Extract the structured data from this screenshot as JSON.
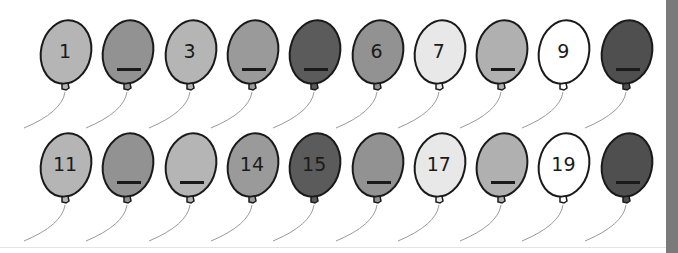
{
  "colors": {
    "light": "#b5b5b5",
    "medium": "#929292",
    "dark": "#5b5b5b",
    "verylight": "#e8e8e8",
    "white": "#ffffff",
    "outline": "#1a1a1a",
    "sidebar": "#7a7a7a"
  },
  "rows": [
    {
      "balloons": [
        {
          "number": "1",
          "fill": "#b5b5b5",
          "blank": false
        },
        {
          "number": "",
          "fill": "#929292",
          "blank": true
        },
        {
          "number": "3",
          "fill": "#b5b5b5",
          "blank": false
        },
        {
          "number": "",
          "fill": "#9a9a9a",
          "blank": true
        },
        {
          "number": "",
          "fill": "#5b5b5b",
          "blank": true
        },
        {
          "number": "6",
          "fill": "#929292",
          "blank": false
        },
        {
          "number": "7",
          "fill": "#e8e8e8",
          "blank": false
        },
        {
          "number": "",
          "fill": "#b0b0b0",
          "blank": true
        },
        {
          "number": "9",
          "fill": "#ffffff",
          "blank": false
        },
        {
          "number": "",
          "fill": "#4f4f4f",
          "blank": true
        }
      ]
    },
    {
      "balloons": [
        {
          "number": "11",
          "fill": "#b5b5b5",
          "blank": false
        },
        {
          "number": "",
          "fill": "#929292",
          "blank": true
        },
        {
          "number": "",
          "fill": "#b5b5b5",
          "blank": true
        },
        {
          "number": "14",
          "fill": "#9a9a9a",
          "blank": false
        },
        {
          "number": "15",
          "fill": "#5b5b5b",
          "blank": false
        },
        {
          "number": "",
          "fill": "#929292",
          "blank": true
        },
        {
          "number": "17",
          "fill": "#e8e8e8",
          "blank": false
        },
        {
          "number": "",
          "fill": "#b0b0b0",
          "blank": true
        },
        {
          "number": "19",
          "fill": "#ffffff",
          "blank": false
        },
        {
          "number": "",
          "fill": "#4f4f4f",
          "blank": true
        }
      ]
    }
  ]
}
